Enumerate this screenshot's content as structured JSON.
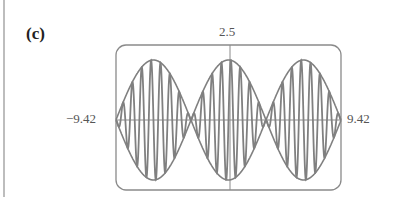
{
  "panel": {
    "label": "(c)"
  },
  "axes": {
    "y_max_label": "2.5",
    "x_min_label": "−9.42",
    "x_max_label": "9.42"
  },
  "colors": {
    "curve": "#808080",
    "frame": "#8a8a8a",
    "axis": "#8a8a8a",
    "text": "#555555"
  },
  "chart_data": {
    "type": "line",
    "title": "(c)",
    "xlabel": "",
    "ylabel": "",
    "xlim": [
      -9.42,
      9.42
    ],
    "ylim": [
      -2.5,
      2.5
    ],
    "tick_labels": {
      "x": [
        "-9.42",
        "9.42"
      ],
      "y": [
        "2.5"
      ]
    },
    "grid": false,
    "legend": null,
    "series": [
      {
        "name": "envelope_upper",
        "description": "2*cos(x/2) envelope (upper)",
        "x": [
          -9.42,
          -6.28,
          -3.14,
          0,
          3.14,
          6.28,
          9.42
        ],
        "values": [
          0,
          2,
          0,
          2,
          0,
          2,
          0
        ],
        "abs_shape": true
      },
      {
        "name": "envelope_lower",
        "description": "-2*|cos(x/2)| envelope (lower)",
        "x": [
          -9.42,
          -6.28,
          -3.14,
          0,
          3.14,
          6.28,
          9.42
        ],
        "values": [
          0,
          -2,
          0,
          -2,
          0,
          -2,
          0
        ]
      },
      {
        "name": "modulated_wave",
        "description": "High-frequency oscillation bounded by the envelope, approx 2*cos(x/2)*sin(8x)",
        "amplitude": 2,
        "envelope_frequency": 0.5,
        "carrier_frequency": 8
      }
    ]
  }
}
